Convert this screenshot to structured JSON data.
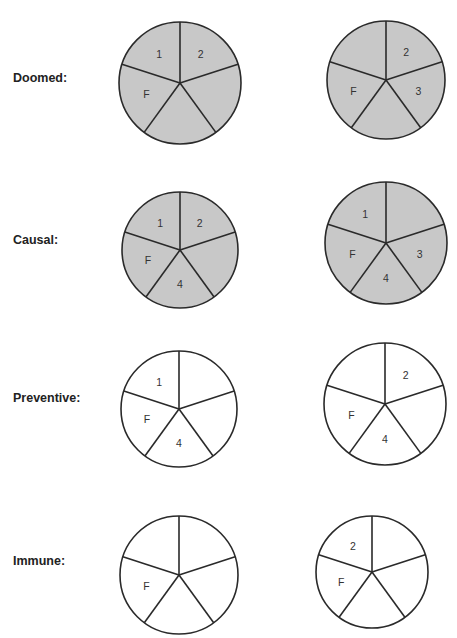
{
  "colors": {
    "filled": "#c8c8c8",
    "empty": "#ffffff",
    "stroke": "#2a2a2a"
  },
  "rows": [
    {
      "label": "Doomed:",
      "label_y": 78,
      "pies": [
        {
          "cx": 180,
          "cy": 83,
          "r": 61,
          "filled": true,
          "labels": [
            {
              "seg": "upper-left",
              "text": "1"
            },
            {
              "seg": "upper-right",
              "text": "2"
            },
            {
              "seg": "left",
              "text": "F"
            }
          ]
        },
        {
          "cx": 386,
          "cy": 80,
          "r": 59,
          "filled": true,
          "labels": [
            {
              "seg": "upper-right",
              "text": "2"
            },
            {
              "seg": "right",
              "text": "3"
            },
            {
              "seg": "left",
              "text": "F"
            }
          ]
        }
      ]
    },
    {
      "label": "Causal:",
      "label_y": 240,
      "pies": [
        {
          "cx": 180,
          "cy": 250,
          "r": 58,
          "filled": true,
          "labels": [
            {
              "seg": "upper-left",
              "text": "1"
            },
            {
              "seg": "upper-right",
              "text": "2"
            },
            {
              "seg": "left",
              "text": "F"
            },
            {
              "seg": "bottom",
              "text": "4"
            }
          ]
        },
        {
          "cx": 386,
          "cy": 243,
          "r": 61,
          "filled": true,
          "labels": [
            {
              "seg": "upper-left",
              "text": "1"
            },
            {
              "seg": "right",
              "text": "3"
            },
            {
              "seg": "left",
              "text": "F"
            },
            {
              "seg": "bottom",
              "text": "4"
            }
          ]
        }
      ]
    },
    {
      "label": "Preventive:",
      "label_y": 398,
      "pies": [
        {
          "cx": 179,
          "cy": 409,
          "r": 58,
          "filled": false,
          "labels": [
            {
              "seg": "upper-left",
              "text": "1"
            },
            {
              "seg": "left",
              "text": "F"
            },
            {
              "seg": "bottom",
              "text": "4"
            }
          ]
        },
        {
          "cx": 385,
          "cy": 404,
          "r": 61,
          "filled": false,
          "labels": [
            {
              "seg": "upper-right",
              "text": "2"
            },
            {
              "seg": "left",
              "text": "F"
            },
            {
              "seg": "bottom",
              "text": "4"
            }
          ]
        }
      ]
    },
    {
      "label": "Immune:",
      "label_y": 561,
      "pies": [
        {
          "cx": 179,
          "cy": 575,
          "r": 59,
          "filled": false,
          "labels": [
            {
              "seg": "left",
              "text": "F"
            }
          ]
        },
        {
          "cx": 372,
          "cy": 572,
          "r": 56,
          "filled": false,
          "labels": [
            {
              "seg": "upper-left",
              "text": "2"
            },
            {
              "seg": "left",
              "text": "F"
            }
          ]
        }
      ]
    }
  ]
}
